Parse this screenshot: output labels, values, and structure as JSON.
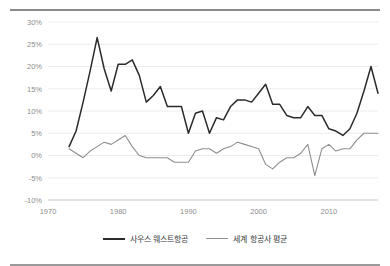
{
  "chart_data": {
    "type": "line",
    "title": "",
    "subtitle": "",
    "xlabel": "",
    "ylabel": "",
    "xlim": [
      1970,
      2017
    ],
    "ylim": [
      -10,
      30
    ],
    "grid": true,
    "legend_position": "bottom",
    "y_ticks": [
      "30%",
      "25%",
      "20%",
      "15%",
      "10%",
      "5%",
      "0%",
      "-5%",
      "-10%"
    ],
    "y_tick_values": [
      30,
      25,
      20,
      15,
      10,
      5,
      0,
      -5,
      -10
    ],
    "x_ticks": [
      "1970",
      "1980",
      "1990",
      "2000",
      "2010"
    ],
    "x_tick_values": [
      1970,
      1980,
      1990,
      2000,
      2010
    ],
    "x": [
      1973,
      1974,
      1975,
      1976,
      1977,
      1978,
      1979,
      1980,
      1981,
      1982,
      1983,
      1984,
      1985,
      1986,
      1987,
      1988,
      1989,
      1990,
      1991,
      1992,
      1993,
      1994,
      1995,
      1996,
      1997,
      1998,
      1999,
      2000,
      2001,
      2002,
      2003,
      2004,
      2005,
      2006,
      2007,
      2008,
      2009,
      2010,
      2011,
      2012,
      2013,
      2014,
      2015,
      2016,
      2017
    ],
    "series": [
      {
        "name": "사우스 웨스트항공",
        "color": "#2b2b2b",
        "values": [
          2.0,
          5.5,
          12.0,
          19.0,
          26.5,
          19.5,
          14.5,
          20.5,
          20.5,
          21.5,
          18.0,
          12.0,
          13.5,
          15.5,
          11.0,
          11.0,
          11.0,
          5.0,
          9.5,
          10.0,
          5.0,
          8.5,
          8.0,
          11.0,
          12.5,
          12.5,
          12.0,
          14.0,
          16.0,
          11.5,
          11.5,
          9.0,
          8.5,
          8.5,
          11.0,
          9.0,
          9.0,
          6.0,
          5.5,
          4.5,
          6.0,
          9.5,
          14.5,
          20.0,
          14.0
        ]
      },
      {
        "name": "세계 항공사 평균",
        "color": "#8e8e8e",
        "values": [
          1.5,
          0.5,
          -0.5,
          1.0,
          2.0,
          3.0,
          2.5,
          3.5,
          4.5,
          2.0,
          0.0,
          -0.5,
          -0.5,
          -0.5,
          -0.5,
          -1.5,
          -1.5,
          -1.5,
          1.0,
          1.5,
          1.5,
          0.5,
          1.5,
          2.0,
          3.0,
          2.5,
          2.0,
          1.5,
          -2.0,
          -3.0,
          -1.5,
          -0.5,
          -0.5,
          0.5,
          2.5,
          -4.5,
          1.5,
          2.5,
          1.0,
          1.5,
          1.5,
          3.5,
          5.0,
          5.0,
          5.0
        ]
      }
    ]
  },
  "legend": {
    "items": [
      {
        "label": "사우스 웨스트항공",
        "color": "#2b2b2b"
      },
      {
        "label": "세계 항공사 평균",
        "color": "#8e8e8e"
      }
    ]
  }
}
